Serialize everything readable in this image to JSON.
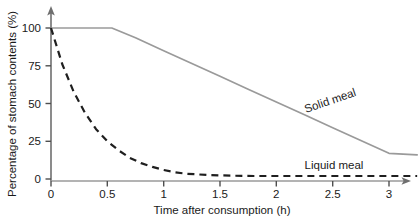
{
  "chart_data": {
    "type": "line",
    "title": "",
    "xlabel": "Time after consumption (h)",
    "ylabel": "Percentage of stomach contents (%)",
    "xlim": [
      0,
      3.3
    ],
    "ylim": [
      0,
      106
    ],
    "grid": false,
    "legend_position": "inline-labels",
    "xticks": [
      0,
      0.5,
      1,
      1.5,
      2,
      2.5,
      3
    ],
    "xticklabels": [
      "0",
      "0.5",
      "1",
      "1.5",
      "2",
      "2.5",
      "3"
    ],
    "yticks": [
      0,
      25,
      50,
      75,
      100
    ],
    "yticklabels": [
      "0",
      "25",
      "50",
      "75",
      "100"
    ],
    "axis_arrows": true,
    "series": [
      {
        "name": "Solid meal",
        "style": "solid",
        "color": "#9a9a9a",
        "label_angle_deg": -19,
        "x": [
          0,
          0.1,
          0.2,
          0.3,
          0.4,
          0.5,
          0.54,
          0.75,
          1,
          1.25,
          1.5,
          1.75,
          2,
          2.25,
          2.5,
          2.75,
          3,
          3.25
        ],
        "values": [
          100,
          100,
          100,
          100,
          100,
          100,
          100,
          93.5,
          85,
          76.5,
          68,
          59.5,
          51,
          42.5,
          34,
          25.5,
          17,
          16
        ]
      },
      {
        "name": "Liquid meal",
        "style": "dashed",
        "color": "#1f1f1f",
        "label_angle_deg": 0,
        "x": [
          0,
          0.1,
          0.2,
          0.3,
          0.4,
          0.5,
          0.6,
          0.7,
          0.8,
          0.9,
          1,
          1.1,
          1.2,
          1.4,
          1.6,
          1.8,
          2,
          2.2,
          2.4,
          2.6,
          2.8,
          3,
          3.25
        ],
        "values": [
          100,
          76,
          58,
          44,
          33,
          25,
          19,
          14,
          10.5,
          8,
          6,
          4.5,
          3.5,
          2.6,
          2.2,
          2,
          2,
          2,
          2,
          2,
          2,
          2,
          2
        ]
      }
    ]
  },
  "labels": {
    "solid_meal": "Solid meal",
    "liquid_meal": "Liquid meal"
  },
  "axes": {
    "x_title": "Time after consumption (h)",
    "y_title": "Percentage of stomach contents (%)",
    "x_tick_0": "0",
    "x_tick_1": "0.5",
    "x_tick_2": "1",
    "x_tick_3": "1.5",
    "x_tick_4": "2",
    "x_tick_5": "2.5",
    "x_tick_6": "3",
    "y_tick_0": "0",
    "y_tick_1": "25",
    "y_tick_2": "50",
    "y_tick_3": "75",
    "y_tick_4": "100"
  },
  "colors": {
    "solid_series": "#9a9a9a",
    "liquid_series": "#1f1f1f",
    "axis": "#6f6f6f",
    "text": "#1a1a1a",
    "background": "#ffffff"
  }
}
